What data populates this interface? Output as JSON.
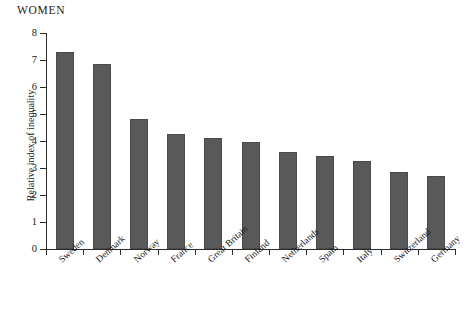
{
  "panel": {
    "title": "WOMEN"
  },
  "chart_data": {
    "type": "bar",
    "title": "WOMEN",
    "xlabel": "",
    "ylabel": "Relative index of inequality",
    "ylim": [
      0,
      8
    ],
    "yticks": [
      0,
      1,
      2,
      3,
      4,
      5,
      6,
      7,
      8
    ],
    "grid": false,
    "legend": null,
    "bar_color": "#595959",
    "categories": [
      "Sweden",
      "Denmark",
      "Norway",
      "France",
      "Great Britain",
      "Finland",
      "Netherlands",
      "Spain",
      "Italy",
      "Switzerland",
      "Germany"
    ],
    "values": [
      7.3,
      6.85,
      4.8,
      4.25,
      4.1,
      3.95,
      3.6,
      3.45,
      3.25,
      2.85,
      2.7
    ]
  }
}
